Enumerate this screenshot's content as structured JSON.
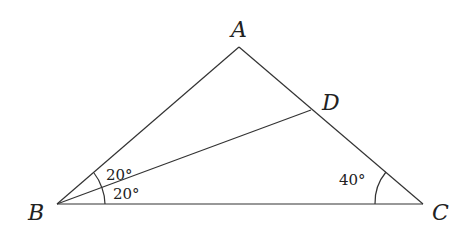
{
  "diagram": {
    "points": {
      "A": "A",
      "B": "B",
      "C": "C",
      "D": "D"
    },
    "angles": {
      "ABD": "20°",
      "DBC": "20°",
      "BCA": "40°"
    },
    "colors": {
      "stroke": "#333333",
      "text": "#222222"
    }
  }
}
